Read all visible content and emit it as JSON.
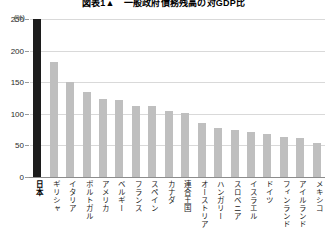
{
  "chart_data": {
    "type": "bar",
    "title": "図表1▲　一般政府債務残高の対GDP比",
    "xlabel": "",
    "ylabel": "",
    "yunit": "(%)",
    "ylim": [
      0,
      250
    ],
    "ytick_labels": [
      "250",
      "200",
      "150",
      "100",
      "50",
      "0"
    ],
    "ytick_values": [
      250,
      200,
      150,
      100,
      50,
      0
    ],
    "grid": true,
    "legend": "none",
    "highlight_category": "日本",
    "highlight_color": "#1c1c1c",
    "bar_color": "#bfbfbf",
    "categories": [
      "日本",
      "ギリシャ",
      "イタリア",
      "ポルトガル",
      "アメリカ",
      "ベルギー",
      "フランス",
      "スペイン",
      "カナダ",
      "連合王国",
      "オーストリア",
      "ハンガリー",
      "スロベニア",
      "イスラエル",
      "ドイツ",
      "フィンランド",
      "アイルランド",
      "メキシコ"
    ],
    "values": [
      250,
      182,
      150,
      134,
      124,
      122,
      113,
      112,
      104,
      102,
      85,
      78,
      75,
      71,
      68,
      64,
      62,
      54
    ]
  }
}
